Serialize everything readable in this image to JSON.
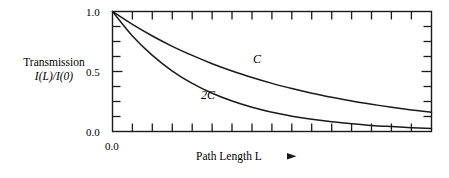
{
  "chart_data": {
    "type": "line",
    "title": "",
    "xlabel": "Path Length L",
    "ylabel_line1": "Transmission",
    "ylabel_line2": "I(L)/I(0)",
    "x": [
      0.0,
      0.0625,
      0.125,
      0.1875,
      0.25,
      0.3125,
      0.375,
      0.4375,
      0.5,
      0.5625,
      0.625,
      0.6875,
      0.75,
      0.8125,
      0.875,
      0.9375,
      1.0
    ],
    "series": [
      {
        "name": "C",
        "label": "C",
        "values": [
          1.0,
          0.892,
          0.796,
          0.71,
          0.634,
          0.565,
          0.504,
          0.45,
          0.401,
          0.358,
          0.319,
          0.285,
          0.254,
          0.227,
          0.202,
          0.18,
          0.16
        ]
      },
      {
        "name": "2C",
        "label": "2C",
        "values": [
          1.0,
          0.796,
          0.634,
          0.504,
          0.401,
          0.319,
          0.254,
          0.202,
          0.16,
          0.128,
          0.102,
          0.081,
          0.065,
          0.051,
          0.041,
          0.032,
          0.026
        ]
      }
    ],
    "xlim": [
      0.0,
      1.0
    ],
    "ylim": [
      0.0,
      1.0
    ],
    "y_ticks_labeled": [
      "1.0",
      "0.5",
      "0.0"
    ],
    "y_tick_values": [
      1.0,
      0.5,
      0.0
    ],
    "y_minor_tick_values": [
      0.875,
      0.75,
      0.625,
      0.375,
      0.25,
      0.125
    ],
    "x_ticks_labeled": [
      "0.0"
    ],
    "x_tick_count": 16,
    "grid": false,
    "legend_position": "inline-annotation",
    "frame": "box",
    "tick_direction": "in",
    "annotations": [
      {
        "text": "C",
        "x": 0.46,
        "y": 0.57
      },
      {
        "text": "2C",
        "x": 0.3,
        "y": 0.3
      }
    ],
    "line_color": "#1a1a1a",
    "axis_color": "#1a1a1a",
    "background_color": "#ffffff"
  },
  "figure": {
    "x_axis_arrow_icon": "right-arrow-icon",
    "x_origin_label": "0.0"
  }
}
